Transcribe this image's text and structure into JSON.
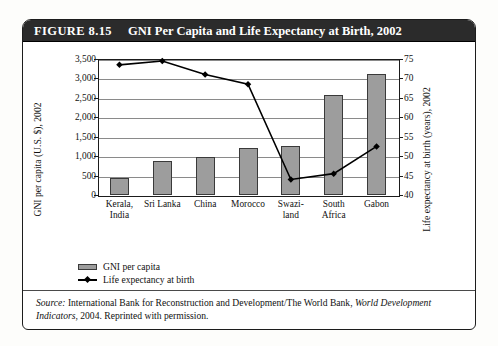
{
  "figure": {
    "number": "FIGURE 8.15",
    "title": "GNI Per Capita and Life Expectancy at Birth, 2002"
  },
  "source": {
    "label": "Source:",
    "line1_a": " International Bank for Reconstruction and Development/The World Bank, ",
    "line1_b": "World",
    "line2_a": "Development Indicators",
    "line2_b": ", 2004. Reprinted with permission."
  },
  "legend": {
    "bar_label": "GNI per capita",
    "line_label": "Life expectancy at birth"
  },
  "chart_data": {
    "type": "bar",
    "title": "GNI Per Capita and Life Expectancy at Birth, 2002",
    "categories": [
      "Kerala, India",
      "Sri Lanka",
      "China",
      "Morocco",
      "Swazi-land",
      "South Africa",
      "Gabon"
    ],
    "category_lines": [
      [
        "Kerala,",
        "India"
      ],
      [
        "Sri Lanka",
        ""
      ],
      [
        "China",
        ""
      ],
      [
        "Morocco",
        ""
      ],
      [
        "Swazi-",
        "land"
      ],
      [
        "South",
        "Africa"
      ],
      [
        "Gabon",
        ""
      ]
    ],
    "xlabel": "",
    "ylabel": "GNI per capita (U.S. $), 2002",
    "y2label": "Life expectancy at birth (years), 2002",
    "ylim": [
      0,
      3500
    ],
    "y2lim": [
      40,
      75
    ],
    "yticks": [
      "0",
      "500",
      "1,000",
      "1,500",
      "2,000",
      "2,500",
      "3,000",
      "3,500"
    ],
    "ytick_values": [
      0,
      500,
      1000,
      1500,
      2000,
      2500,
      3000,
      3500
    ],
    "y2ticks": [
      "40",
      "45",
      "50",
      "55",
      "60",
      "65",
      "70",
      "75"
    ],
    "y2tick_values": [
      40,
      45,
      50,
      55,
      60,
      65,
      70,
      75
    ],
    "grid": true,
    "legend_position": "below-left",
    "series": [
      {
        "name": "GNI per capita",
        "kind": "bar",
        "axis": "left",
        "units": "U.S. $",
        "color": "#9d9d9d",
        "values": [
          450,
          870,
          990,
          1200,
          1260,
          2570,
          3120
        ]
      },
      {
        "name": "Life expectancy at birth",
        "kind": "line",
        "axis": "right",
        "units": "years",
        "color": "#000000",
        "values": [
          73.5,
          74.5,
          71.0,
          68.5,
          44.0,
          45.5,
          52.5
        ]
      }
    ]
  }
}
